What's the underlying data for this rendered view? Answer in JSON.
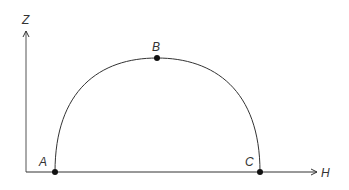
{
  "diagram": {
    "axes": {
      "vertical": {
        "label": "Z"
      },
      "horizontal": {
        "label": "H"
      }
    },
    "points": [
      {
        "label": "A",
        "x": 55,
        "y": 172
      },
      {
        "label": "B",
        "x": 157,
        "y": 58
      },
      {
        "label": "C",
        "x": 260,
        "y": 172
      }
    ],
    "curve": "semi-elliptical arc from A through B to C"
  }
}
